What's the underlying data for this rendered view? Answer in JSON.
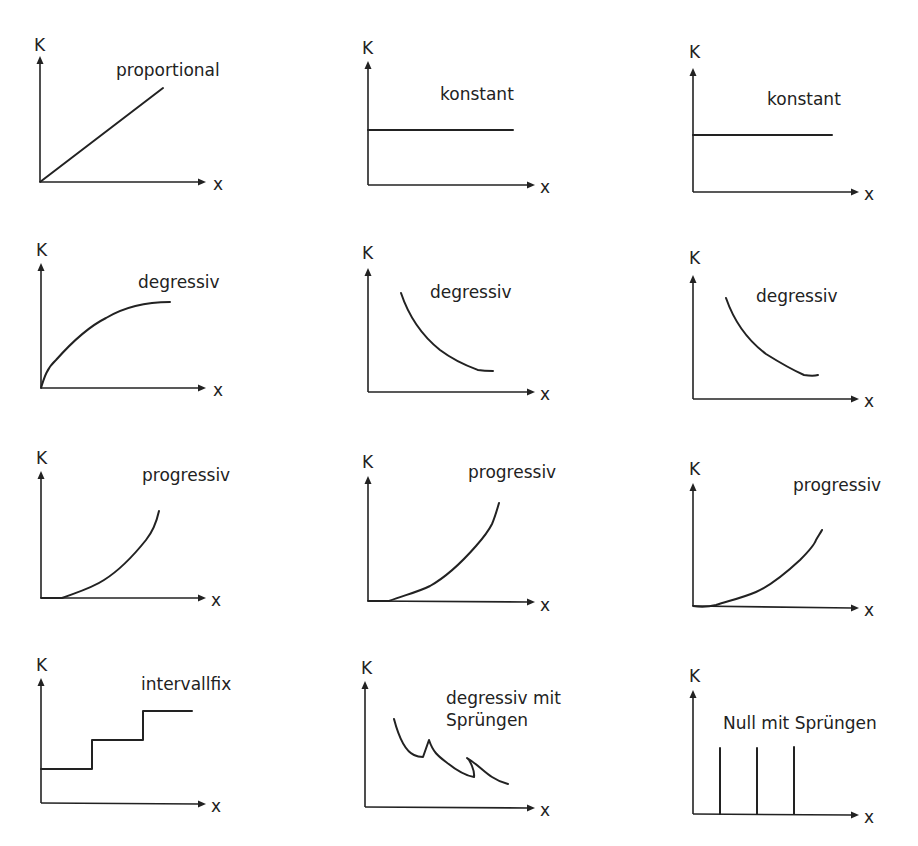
{
  "figure": {
    "axis_labels": {
      "y": "K",
      "x": "x"
    },
    "panels": [
      {
        "id": "p1",
        "label": "proportional"
      },
      {
        "id": "p2",
        "label": "konstant"
      },
      {
        "id": "p3",
        "label": "konstant"
      },
      {
        "id": "p4",
        "label": "degressiv"
      },
      {
        "id": "p5",
        "label": "degressiv"
      },
      {
        "id": "p6",
        "label": "degressiv"
      },
      {
        "id": "p7",
        "label": "progressiv"
      },
      {
        "id": "p8",
        "label": "progressiv"
      },
      {
        "id": "p9",
        "label": "progressiv"
      },
      {
        "id": "p10",
        "label": "intervallfix"
      },
      {
        "id": "p11",
        "label_line1": "degressiv mit",
        "label_line2": "Sprüngen"
      },
      {
        "id": "p12",
        "label": "Null mit Sprüngen"
      }
    ],
    "caption": ""
  }
}
